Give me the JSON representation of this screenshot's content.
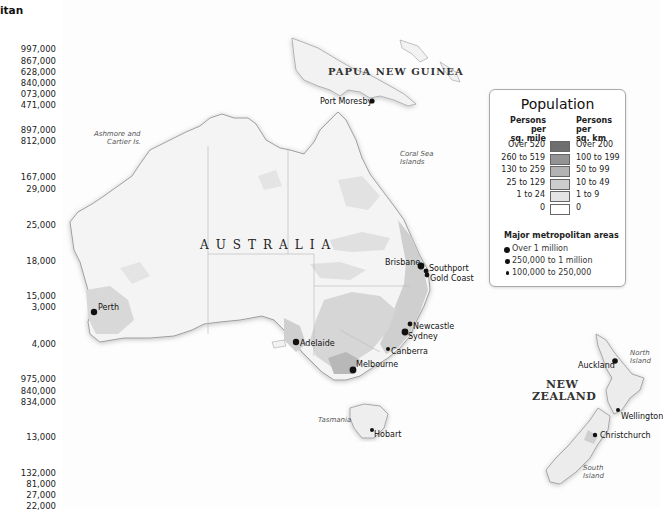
{
  "left_column": {
    "header_fragment": "itan",
    "values": [
      "997,000",
      "867,000",
      "628,000",
      "840,000",
      "073,000",
      "471,000",
      "897,000",
      "812,000",
      "167,000",
      "29,000",
      "25,000",
      "18,000",
      "15,000",
      "3,000",
      "4,000",
      "975,000",
      "840,000",
      "834,000",
      "13,000",
      "132,000",
      "81,000",
      "27,000",
      "22,000"
    ]
  },
  "countries": {
    "papua": "PAPUA NEW GUINEA",
    "australia": "AUSTRALIA",
    "nz_line1": "NEW",
    "nz_line2": "ZEALAND"
  },
  "regions": {
    "ashmore_line1": "Ashmore and",
    "ashmore_line2": "Cartier Is.",
    "coral_line1": "Coral Sea",
    "coral_line2": "Islands",
    "tasmania": "Tasmania",
    "north_island_1": "North",
    "north_island_2": "Island",
    "south_island_1": "South",
    "south_island_2": "Island"
  },
  "cities": {
    "port_moresby": "Port Moresby",
    "perth": "Perth",
    "adelaide": "Adelaide",
    "melbourne": "Melbourne",
    "canberra": "Canberra",
    "sydney": "Sydney",
    "newcastle": "Newcastle",
    "brisbane": "Brisbane",
    "southport": "Southport",
    "gold_coast": "Gold Coast",
    "hobart": "Hobart",
    "auckland": "Auckland",
    "wellington": "Wellington",
    "christchurch": "Christchurch"
  },
  "legend": {
    "title": "Population",
    "col_left": "Persons per sq. mile",
    "col_left_1": "Persons per",
    "col_left_2": "sq. mile",
    "col_right_1": "Persons per",
    "col_right_2": "sq. km",
    "classes": [
      {
        "mile": "Over 520",
        "km": "Over 200",
        "color": "#6e6e6e"
      },
      {
        "mile": "260 to 519",
        "km": "100 to 199",
        "color": "#939393"
      },
      {
        "mile": "130 to 259",
        "km": "50 to 99",
        "color": "#b3b3b3"
      },
      {
        "mile": "25 to 129",
        "km": "10 to 49",
        "color": "#cdcdcd"
      },
      {
        "mile": "1 to 24",
        "km": "1 to 9",
        "color": "#e4e4e4"
      },
      {
        "mile": "0",
        "km": "0",
        "color": "#ffffff"
      }
    ],
    "metro_header": "Major metropolitan areas",
    "metro": [
      "Over 1 million",
      "250,000 to 1 million",
      "100,000 to 250,000"
    ]
  }
}
